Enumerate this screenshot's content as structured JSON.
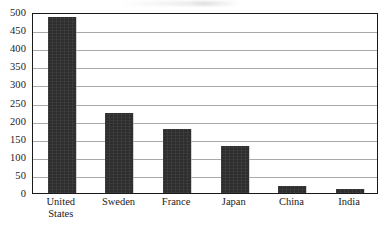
{
  "chart_data": {
    "type": "bar",
    "title": "",
    "xlabel": "",
    "ylabel": "",
    "categories": [
      "United States",
      "Sweden",
      "France",
      "Japan",
      "China",
      "India"
    ],
    "category_lines": [
      [
        "United",
        "States"
      ],
      [
        "Sweden"
      ],
      [
        "France"
      ],
      [
        "Japan"
      ],
      [
        "China"
      ],
      [
        "India"
      ]
    ],
    "values": [
      485,
      220,
      178,
      130,
      20,
      12
    ],
    "ylim": [
      0,
      500
    ],
    "ytick_step": 50,
    "yticks": [
      500,
      450,
      400,
      350,
      300,
      250,
      200,
      150,
      100,
      50,
      0
    ],
    "ytick_labels": [
      "500",
      "450",
      "400",
      "350",
      "300",
      "250",
      "200",
      "150",
      "100",
      "50",
      "0"
    ],
    "grid": true,
    "grid_axis": "y",
    "legend": null,
    "legend_position": "none",
    "bar_color": "#2e2e2e",
    "gridline_color": "#a9a9a9",
    "frame_color": "#1a1a1a",
    "background_color": "#ffffff"
  }
}
